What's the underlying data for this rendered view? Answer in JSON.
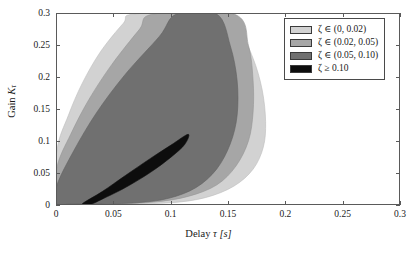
{
  "chart_data": {
    "type": "area",
    "title": "",
    "xlabel": "Delay τ [s]",
    "ylabel": "Gain Kτ",
    "xlabel_text": "Delay",
    "xlabel_symbol": "τ",
    "xlabel_unit": "[s]",
    "ylabel_text": "Gain",
    "ylabel_symbol": "K",
    "ylabel_subscript": "τ",
    "xlim": [
      0,
      0.3
    ],
    "ylim": [
      0,
      0.3
    ],
    "xticks": [
      "0",
      "0.05",
      "0.1",
      "0.15",
      "0.2",
      "0.25",
      "0.3"
    ],
    "xtick_values": [
      0,
      0.05,
      0.1,
      0.15,
      0.2,
      0.25,
      0.3
    ],
    "yticks": [
      "0",
      "0.05",
      "0.1",
      "0.15",
      "0.2",
      "0.25",
      "0.3"
    ],
    "ytick_values": [
      0,
      0.05,
      0.1,
      0.15,
      0.2,
      0.25,
      0.3
    ],
    "grid": false,
    "legend_position": "top-right",
    "regions": [
      {
        "name": "zeta-0-002",
        "label": "ζ ∈ (0, 0.02)",
        "color": "#d2d2d2",
        "outline": "#bdbdbd",
        "description": "Outermost light-gray band of low damping ratio",
        "boundary_outer": [
          [
            0.0,
            0.085
          ],
          [
            0.01,
            0.14
          ],
          [
            0.022,
            0.19
          ],
          [
            0.038,
            0.24
          ],
          [
            0.058,
            0.285
          ],
          [
            0.068,
            0.3
          ],
          [
            0.135,
            0.3
          ],
          [
            0.16,
            0.27
          ],
          [
            0.172,
            0.23
          ],
          [
            0.18,
            0.18
          ],
          [
            0.183,
            0.13
          ],
          [
            0.181,
            0.09
          ],
          [
            0.172,
            0.055
          ],
          [
            0.155,
            0.028
          ],
          [
            0.13,
            0.01
          ],
          [
            0.1,
            0.002
          ],
          [
            0.06,
            0.0
          ],
          [
            0.02,
            0.0
          ],
          [
            0.0,
            0.0
          ]
        ]
      },
      {
        "name": "zeta-002-005",
        "label": "ζ ∈ (0.02, 0.05)",
        "color": "#a6a6a6",
        "outline": "#949494",
        "description": "Second band, medium gray",
        "boundary_outer": [
          [
            0.0,
            0.058
          ],
          [
            0.012,
            0.11
          ],
          [
            0.028,
            0.165
          ],
          [
            0.048,
            0.22
          ],
          [
            0.072,
            0.275
          ],
          [
            0.085,
            0.3
          ],
          [
            0.155,
            0.3
          ],
          [
            0.168,
            0.25
          ],
          [
            0.172,
            0.195
          ],
          [
            0.172,
            0.145
          ],
          [
            0.168,
            0.1
          ],
          [
            0.157,
            0.06
          ],
          [
            0.14,
            0.03
          ],
          [
            0.115,
            0.012
          ],
          [
            0.085,
            0.003
          ],
          [
            0.05,
            0.0
          ],
          [
            0.018,
            0.0
          ],
          [
            0.0,
            0.0
          ]
        ]
      },
      {
        "name": "zeta-005-010",
        "label": "ζ ∈ (0.05, 0.10)",
        "color": "#707070",
        "outline": "#606060",
        "description": "Third band, dark gray",
        "boundary_outer": [
          [
            0.0,
            0.03
          ],
          [
            0.015,
            0.085
          ],
          [
            0.035,
            0.145
          ],
          [
            0.06,
            0.205
          ],
          [
            0.09,
            0.265
          ],
          [
            0.105,
            0.3
          ],
          [
            0.14,
            0.3
          ],
          [
            0.152,
            0.25
          ],
          [
            0.158,
            0.195
          ],
          [
            0.158,
            0.14
          ],
          [
            0.152,
            0.095
          ],
          [
            0.14,
            0.055
          ],
          [
            0.122,
            0.026
          ],
          [
            0.098,
            0.009
          ],
          [
            0.07,
            0.002
          ],
          [
            0.035,
            0.0
          ],
          [
            0.012,
            0.0
          ],
          [
            0.0,
            0.0
          ]
        ]
      },
      {
        "name": "zeta-ge-010",
        "label": "ζ ≥ 0.10",
        "color": "#0d0d0d",
        "outline": "#0d0d0d",
        "description": "Innermost black crescent tapering to a tip near (0.115, 0.110)",
        "boundary_outer": [
          [
            0.022,
            0.0
          ],
          [
            0.04,
            0.02
          ],
          [
            0.06,
            0.045
          ],
          [
            0.082,
            0.072
          ],
          [
            0.1,
            0.093
          ],
          [
            0.115,
            0.11
          ],
          [
            0.112,
            0.094
          ],
          [
            0.1,
            0.074
          ],
          [
            0.082,
            0.05
          ],
          [
            0.06,
            0.026
          ],
          [
            0.04,
            0.008
          ],
          [
            0.03,
            0.0
          ]
        ]
      }
    ]
  },
  "legend": {
    "entries": [
      {
        "swatch_color": "#d2d2d2",
        "label": "ζ ∈ (0, 0.02)"
      },
      {
        "swatch_color": "#a6a6a6",
        "label": "ζ ∈ (0.02, 0.05)"
      },
      {
        "swatch_color": "#707070",
        "label": "ζ ∈ (0.05, 0.10)"
      },
      {
        "swatch_color": "#0d0d0d",
        "label": "ζ ≥ 0.10"
      }
    ]
  }
}
